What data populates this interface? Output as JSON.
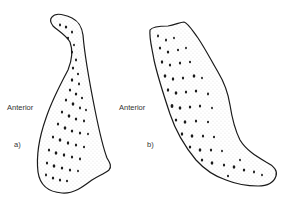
{
  "figure": {
    "panels": [
      {
        "id": "a",
        "panel_label": "a)",
        "side_label": "Anterior"
      },
      {
        "id": "b",
        "panel_label": "b)",
        "side_label": "Anterior"
      }
    ],
    "colors": {
      "outline": "#1a1a1a",
      "pores": "#1a1a1a",
      "stipple": "#777777",
      "background": "#ffffff",
      "text": "#333333"
    }
  }
}
